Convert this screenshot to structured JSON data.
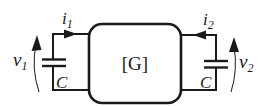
{
  "diagram": {
    "block_label": "[G]",
    "left_port": {
      "current_label": "i",
      "current_sub": "1",
      "voltage_label": "v",
      "voltage_sub": "1",
      "capacitor_label": "C",
      "current_direction": "into-block"
    },
    "right_port": {
      "current_label": "i",
      "current_sub": "2",
      "voltage_label": "v",
      "voltage_sub": "2",
      "capacitor_label": "C",
      "current_direction": "into-block"
    },
    "colors": {
      "stroke": "#1a1a1a",
      "background": "#ffffff"
    }
  }
}
